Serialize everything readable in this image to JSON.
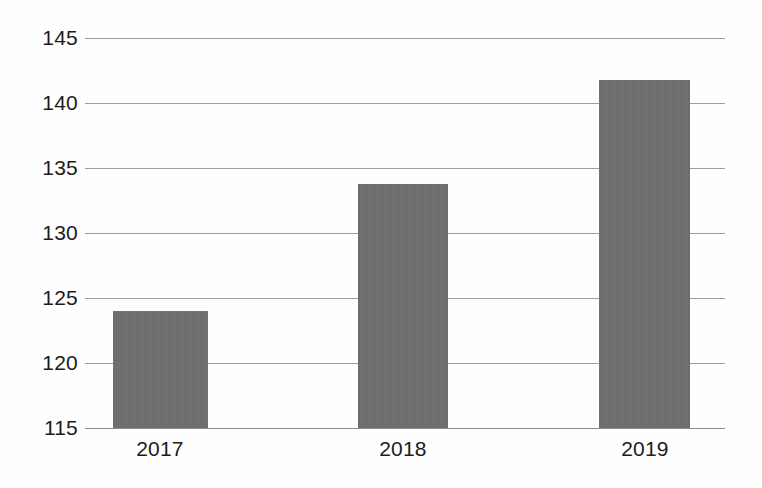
{
  "chart_data": {
    "type": "bar",
    "title": "",
    "subtitle": "",
    "xlabel": "",
    "ylabel": "",
    "categories": [
      "2017",
      "2018",
      "2019"
    ],
    "values": [
      124.0,
      133.8,
      141.8
    ],
    "series": [
      {
        "name": "",
        "values": [
          124.0,
          133.8,
          141.8
        ]
      }
    ],
    "ylim": [
      115,
      145
    ],
    "yticks": [
      115,
      120,
      125,
      130,
      135,
      140,
      145
    ],
    "ytick_labels": [
      "115",
      "120",
      "125",
      "130",
      "135",
      "140",
      "145"
    ],
    "xtick_labels": [
      "2017",
      "2018",
      "2019"
    ],
    "grid": true,
    "grid_axis": "y",
    "legend": false,
    "legend_position": "none",
    "annotations": [],
    "colors": {
      "bar_fill": "#666666",
      "gridline": "#9d9d9d",
      "axis_line": "#8a8a8a",
      "text": "#1c1c1c",
      "background": "#fefefe"
    }
  }
}
